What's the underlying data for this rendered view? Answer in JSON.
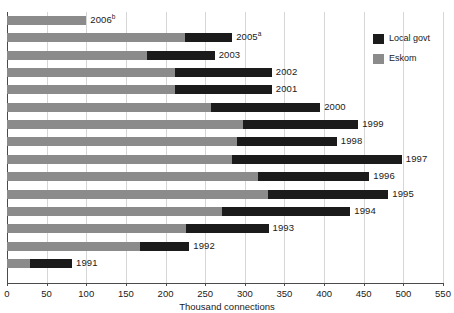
{
  "chart_data": {
    "type": "bar",
    "orientation": "horizontal",
    "stacked": true,
    "title": "",
    "xlabel": "Thousand connections",
    "ylabel": "",
    "xlim": [
      0,
      550
    ],
    "xticks": [
      0,
      50,
      100,
      150,
      200,
      250,
      300,
      350,
      400,
      450,
      500,
      550
    ],
    "xtick_labels": [
      "0",
      "50",
      "100",
      "150",
      "200",
      "250",
      "300",
      "350",
      "400",
      "450",
      "500",
      "550"
    ],
    "grid": true,
    "grid_axis": "x",
    "legend_position": "top-right",
    "categories": [
      "2006",
      "2005",
      "2003",
      "2002",
      "2001",
      "2000",
      "1999",
      "1998",
      "1997",
      "1996",
      "1995",
      "1994",
      "1993",
      "1992",
      "1991"
    ],
    "category_labels": [
      "2006",
      "2005",
      "2003",
      "2002",
      "2001",
      "2000",
      "1999",
      "1998",
      "1997",
      "1996",
      "1995",
      "1994",
      "1993",
      "1992",
      "1991"
    ],
    "category_footnotes": [
      "b",
      "a",
      "",
      "",
      "",
      "",
      "",
      "",
      "",
      "",
      "",
      "",
      "",
      "",
      ""
    ],
    "series": [
      {
        "name": "Eskom",
        "color": "#8b8b8b",
        "values": [
          100,
          224,
          176,
          212,
          212,
          257,
          298,
          290,
          284,
          317,
          329,
          271,
          226,
          168,
          29
        ]
      },
      {
        "name": "Local govt",
        "color": "#1b1b1b",
        "values": [
          0,
          60,
          86,
          122,
          122,
          138,
          145,
          126,
          214,
          140,
          152,
          162,
          104,
          62,
          53
        ]
      }
    ],
    "totals": [
      100,
      284,
      262,
      334,
      334,
      395,
      443,
      416,
      498,
      457,
      481,
      433,
      330,
      230,
      82
    ]
  },
  "legend": {
    "items": [
      {
        "label": "Local govt",
        "color": "#1b1b1b"
      },
      {
        "label": "Eskom",
        "color": "#8b8b8b"
      }
    ]
  }
}
